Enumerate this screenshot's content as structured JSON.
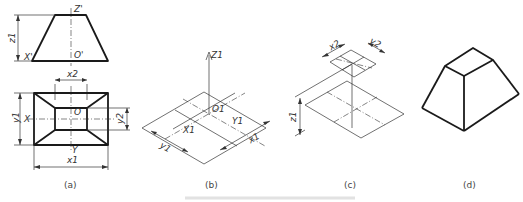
{
  "figure": {
    "panels": [
      {
        "id": "a",
        "caption": "(a)",
        "description": "Orthographic front and top views of frustum with dimensions",
        "labels": {
          "z_top": "Z'",
          "x_left": "X'",
          "origin_front": "O'",
          "z_dim": "z1",
          "x2_dim": "x2",
          "y1_dim": "y1",
          "y2_dim": "y2",
          "x_axis": "X",
          "origin_top": "O",
          "y_axis": "Y",
          "x1_dim": "x1"
        }
      },
      {
        "id": "b",
        "caption": "(b)",
        "description": "Isometric axes with bottom rectangle x1 by y1",
        "labels": {
          "z_axis": "Z1",
          "origin": "O1",
          "y_axis": "Y1",
          "x_axis": "X1",
          "y_dim": "y1",
          "x_dim": "x1"
        }
      },
      {
        "id": "c",
        "caption": "(c)",
        "description": "Top rectangle x2 by y2 raised by height z1",
        "labels": {
          "x_dim": "x2",
          "y_dim": "y2",
          "z_dim": "z1"
        }
      },
      {
        "id": "d",
        "caption": "(d)",
        "description": "Completed isometric frustum"
      }
    ]
  }
}
